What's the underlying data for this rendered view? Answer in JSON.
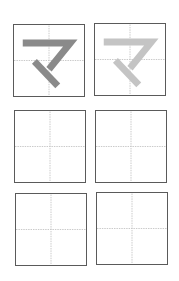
{
  "worksheet": {
    "character": "マ",
    "cells": [
      {
        "role": "model",
        "stroke_color": "#8a8a8a"
      },
      {
        "role": "trace",
        "stroke_color": "#c4c4c4"
      },
      {
        "role": "blank"
      },
      {
        "role": "blank"
      },
      {
        "role": "blank"
      },
      {
        "role": "blank"
      }
    ],
    "guide_color": "#c8c8c8",
    "border_color": "#5a5a5a"
  }
}
